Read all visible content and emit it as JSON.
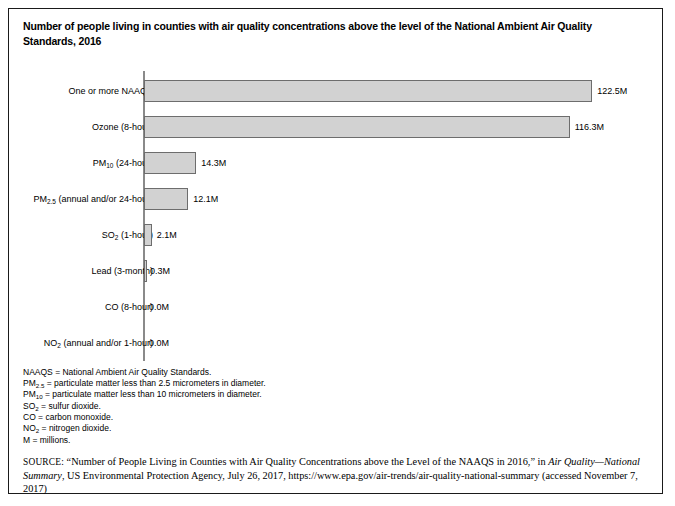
{
  "figure": {
    "title": "Number of people living in counties with air quality concentrations above the level of the National Ambient Air Quality Standards, 2016"
  },
  "chart_data": {
    "type": "bar",
    "orientation": "horizontal",
    "title": "Number of people living in counties with air quality concentrations above the level of the National Ambient Air Quality Standards, 2016",
    "xlabel": "",
    "ylabel": "",
    "grid": false,
    "legend": "none",
    "axis_visible": "y-axis-only",
    "xlim": [
      0,
      135
    ],
    "units": "millions of people",
    "categories": [
      "One or more NAAQS",
      "Ozone (8-hour)",
      "PM10 (24-hour)",
      "PM2.5 (annual and/or 24-hour)",
      "SO2 (1-hour)",
      "Lead (3-month)",
      "CO (8-hour)",
      "NO2 (annual and/or 1-hour)"
    ],
    "values": [
      122.5,
      116.3,
      14.3,
      12.1,
      2.1,
      0.3,
      0.0,
      0.0
    ],
    "data_labels": [
      "122.5M",
      "116.3M",
      "14.3M",
      "12.1M",
      "2.1M",
      "0.3M",
      "0.0M",
      "0.0M"
    ],
    "bar_fill_color": "#d2d2d2",
    "bar_border_color": "#6d6d6d",
    "axis_color": "#8a8a8a"
  },
  "bars": [
    {
      "label_main": "One or more NAAQS",
      "label_sub": "",
      "label_tail": "",
      "value": 122.5,
      "value_label": "122.5M"
    },
    {
      "label_main": "Ozone (8-hour)",
      "label_sub": "",
      "label_tail": "",
      "value": 116.3,
      "value_label": "116.3M"
    },
    {
      "label_main": "PM",
      "label_sub": "10",
      "label_tail": " (24-hour)",
      "value": 14.3,
      "value_label": "14.3M"
    },
    {
      "label_main": "PM",
      "label_sub": "2.5",
      "label_tail": " (annual and/or 24-hour)",
      "value": 12.1,
      "value_label": "12.1M"
    },
    {
      "label_main": "SO",
      "label_sub": "2",
      "label_tail": " (1-hour)",
      "value": 2.1,
      "value_label": "2.1M"
    },
    {
      "label_main": "Lead (3-month)",
      "label_sub": "",
      "label_tail": "",
      "value": 0.3,
      "value_label": "0.3M"
    },
    {
      "label_main": "CO (8-hour)",
      "label_sub": "",
      "label_tail": "",
      "value": 0.0,
      "value_label": "0.0M"
    },
    {
      "label_main": "NO",
      "label_sub": "2",
      "label_tail": " (annual and/or 1-hour)",
      "value": 0.0,
      "value_label": "0.0M"
    }
  ],
  "notes": [
    {
      "term": "NAAQS",
      "sub": "",
      "rest": " = National Ambient Air Quality Standards."
    },
    {
      "term": "PM",
      "sub": "2.5",
      "rest": " = particulate matter less than 2.5 micrometers in diameter."
    },
    {
      "term": "PM",
      "sub": "10",
      "rest": " = particulate matter less than 10 micrometers in diameter."
    },
    {
      "term": "SO",
      "sub": "2",
      "rest": " = sulfur dioxide."
    },
    {
      "term": "CO",
      "sub": "",
      "rest": " = carbon monoxide."
    },
    {
      "term": "NO",
      "sub": "2",
      "rest": " = nitrogen dioxide."
    },
    {
      "term": "M",
      "sub": "",
      "rest": " = millions."
    }
  ],
  "source": {
    "kicker": "SOURCE:",
    "part1": " “Number of People Living in Counties with Air Quality Concentrations above the Level of the NAAQS in 2016,” in ",
    "italic1": "Air Quality—National Summary",
    "part2": ", US Environmental Protection Agency, July 26, 2017, https://www.epa.gov/air-trends/air-quality-national-summary (accessed November 7, 2017)"
  }
}
